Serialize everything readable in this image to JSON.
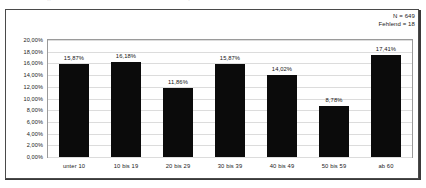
{
  "artifacts": {
    "left_fragment": "··",
    "right_fragment": "·"
  },
  "annotations": {
    "n_label": "N = 649",
    "missing_label": "Fehlend = 18"
  },
  "chart_data": {
    "type": "bar",
    "title": "",
    "subtitle": "",
    "xlabel": "",
    "ylabel": "",
    "categories": [
      "unter 10",
      "10 bis 19",
      "20 bis 29",
      "30 bis 39",
      "40 bis 49",
      "50 bis 59",
      "ab 60"
    ],
    "values": [
      15.87,
      16.18,
      11.86,
      15.87,
      14.02,
      8.78,
      17.41
    ],
    "value_labels": [
      "15,87%",
      "16,18%",
      "11,86%",
      "15,87%",
      "14,02%",
      "8,78%",
      "17,41%"
    ],
    "ylim": [
      0,
      20
    ],
    "y_ticks": [
      20,
      18,
      16,
      14,
      12,
      10,
      8,
      6,
      4,
      2,
      0
    ],
    "y_tick_labels": [
      "20,00%",
      "18,00%",
      "16,00%",
      "14,00%",
      "12,00%",
      "10,00%",
      "8,00%",
      "6,00%",
      "4,00%",
      "2,00%",
      "0,00%"
    ],
    "grid": true,
    "legend": false,
    "bar_color": "#0b0b0b",
    "grid_color": "#dcdcdc",
    "axis_color": "#9a9a9a",
    "frame_color": "#4a4a4a"
  }
}
